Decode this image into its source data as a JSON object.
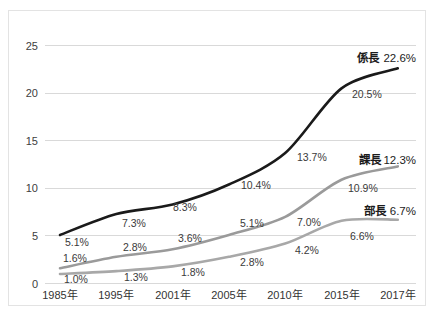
{
  "chart_data": {
    "type": "line",
    "title": "",
    "subtitle": "",
    "xlabel": "",
    "ylabel": "",
    "ylim": [
      0,
      25
    ],
    "yticks": [
      0,
      5,
      10,
      15,
      20,
      25
    ],
    "ytick_labels": [
      "0",
      "5",
      "10",
      "15",
      "20",
      "25"
    ],
    "grid": true,
    "legend_position": "end-of-line",
    "categories": [
      "1985年",
      "1995年",
      "2001年",
      "2005年",
      "2010年",
      "2015年",
      "2017年"
    ],
    "series": [
      {
        "name": "係長",
        "color": "#1a1a1a",
        "stroke_width": 2.6,
        "values": [
          5.1,
          7.3,
          8.3,
          10.4,
          13.7,
          20.5,
          22.6
        ],
        "value_labels": [
          "5.1%",
          "7.3%",
          "8.3%",
          "10.4%",
          "13.7%",
          "20.5%",
          ""
        ],
        "end_label": "係長 22.6%",
        "end_value_text": "22.6%"
      },
      {
        "name": "課長",
        "color": "#9a9a9a",
        "stroke_width": 2.6,
        "values": [
          1.6,
          2.8,
          3.6,
          5.1,
          7.0,
          10.9,
          12.3
        ],
        "value_labels": [
          "1.6%",
          "2.8%",
          "3.6%",
          "5.1%",
          "7.0%",
          "10.9%",
          ""
        ],
        "end_label": "課長 12.3%",
        "end_value_text": "12.3%"
      },
      {
        "name": "部長",
        "color": "#a8a8a8",
        "stroke_width": 2.6,
        "values": [
          1.0,
          1.3,
          1.8,
          2.8,
          4.2,
          6.6,
          6.7
        ],
        "value_labels": [
          "1.0%",
          "1.3%",
          "1.8%",
          "2.8%",
          "4.2%",
          "6.6%",
          ""
        ],
        "end_label": "部長 6.7%",
        "end_value_text": "6.7%"
      }
    ]
  },
  "axis": {
    "y": {
      "t0": "0",
      "t1": "5",
      "t2": "10",
      "t3": "15",
      "t4": "20",
      "t5": "25"
    },
    "x": {
      "c0": "1985年",
      "c1": "1995年",
      "c2": "2001年",
      "c3": "2005年",
      "c4": "2010年",
      "c5": "2015年",
      "c6": "2017年"
    }
  },
  "labels": {
    "kakaricho": {
      "p0": "5.1%",
      "p1": "7.3%",
      "p2": "8.3%",
      "p3": "10.4%",
      "p4": "13.7%",
      "p5": "20.5%",
      "end_name": "係長",
      "end_value": "22.6%"
    },
    "kacho": {
      "p0": "1.6%",
      "p1": "2.8%",
      "p2": "3.6%",
      "p3": "5.1%",
      "p4": "7.0%",
      "p5": "10.9%",
      "end_name": "課長",
      "end_value": "12.3%"
    },
    "bucho": {
      "p0": "1.0%",
      "p1": "1.3%",
      "p2": "1.8%",
      "p3": "2.8%",
      "p4": "4.2%",
      "p5": "6.6%",
      "end_name": "部長",
      "end_value": "6.7%"
    }
  },
  "colors": {
    "series_dark": "#1a1a1a",
    "series_mid": "#9a9a9a",
    "series_light": "#a8a8a8",
    "gridline": "#d9d9d9",
    "frame_border": "#e3e3e3",
    "text": "#333333",
    "background": "#ffffff"
  }
}
